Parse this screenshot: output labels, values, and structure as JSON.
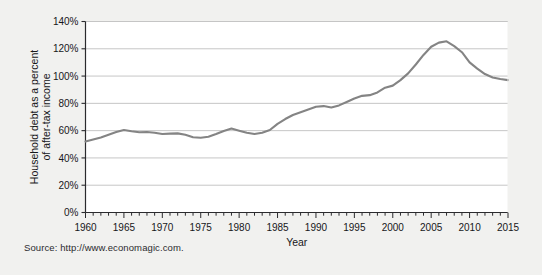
{
  "figure": {
    "background_color": "#f1f1ef",
    "plot_background_color": "#ffffff",
    "source_note": "Source: http://www.economagic.com."
  },
  "chart_data": {
    "type": "line",
    "title": "",
    "xlabel": "Year",
    "ylabel": "Household debt as a percent of after-tax income",
    "ylabel_line1": "Household debt as a percent",
    "ylabel_line2": "of after-tax income",
    "xlim": [
      1960,
      2015
    ],
    "ylim": [
      0,
      140
    ],
    "ytick_labels": [
      "0%",
      "20%",
      "40%",
      "60%",
      "80%",
      "100%",
      "120%",
      "140%"
    ],
    "ytick_values": [
      0,
      20,
      40,
      60,
      80,
      100,
      120,
      140
    ],
    "xtick_labels": [
      "1960",
      "1965",
      "1970",
      "1975",
      "1980",
      "1985",
      "1990",
      "1995",
      "2000",
      "2005",
      "2010",
      "2015"
    ],
    "xtick_values": [
      1960,
      1965,
      1970,
      1975,
      1980,
      1985,
      1990,
      1995,
      2000,
      2005,
      2010,
      2015
    ],
    "minor_xtick_interval": 1,
    "grid": "horizontal",
    "grid_color": "#b8b8b8",
    "legend": "none",
    "line_color": "#848484",
    "line_width": 2.1,
    "series": [
      {
        "name": "Household debt as a percent of after-tax income",
        "x": [
          1960,
          1961,
          1962,
          1963,
          1964,
          1965,
          1966,
          1967,
          1968,
          1969,
          1970,
          1971,
          1972,
          1973,
          1974,
          1975,
          1976,
          1977,
          1978,
          1979,
          1980,
          1981,
          1982,
          1983,
          1984,
          1985,
          1986,
          1987,
          1988,
          1989,
          1990,
          1991,
          1992,
          1993,
          1994,
          1995,
          1996,
          1997,
          1998,
          1999,
          2000,
          2001,
          2002,
          2003,
          2004,
          2005,
          2006,
          2007,
          2008,
          2009,
          2010,
          2011,
          2012,
          2013,
          2014,
          2015
        ],
        "values": [
          52.0,
          53.5,
          55.0,
          57.0,
          59.0,
          60.5,
          59.5,
          58.8,
          59.0,
          58.5,
          57.5,
          57.8,
          58.0,
          57.0,
          55.2,
          54.8,
          55.5,
          57.5,
          59.8,
          61.5,
          60.0,
          58.5,
          57.5,
          58.5,
          60.5,
          65.0,
          68.5,
          71.5,
          73.5,
          75.5,
          77.5,
          78.0,
          77.0,
          78.5,
          81.0,
          83.5,
          85.5,
          86.0,
          88.0,
          91.5,
          93.0,
          97.0,
          102.0,
          108.5,
          115.5,
          121.5,
          124.5,
          125.5,
          122.0,
          117.5,
          110.0,
          105.5,
          101.5,
          99.0,
          97.8,
          97.0
        ]
      }
    ],
    "annotations": {
      "peak_year": 2007,
      "peak_value": 125.5,
      "start_year": 1960,
      "start_value": 52.0,
      "end_year": 2015,
      "end_value": 97.0
    }
  }
}
